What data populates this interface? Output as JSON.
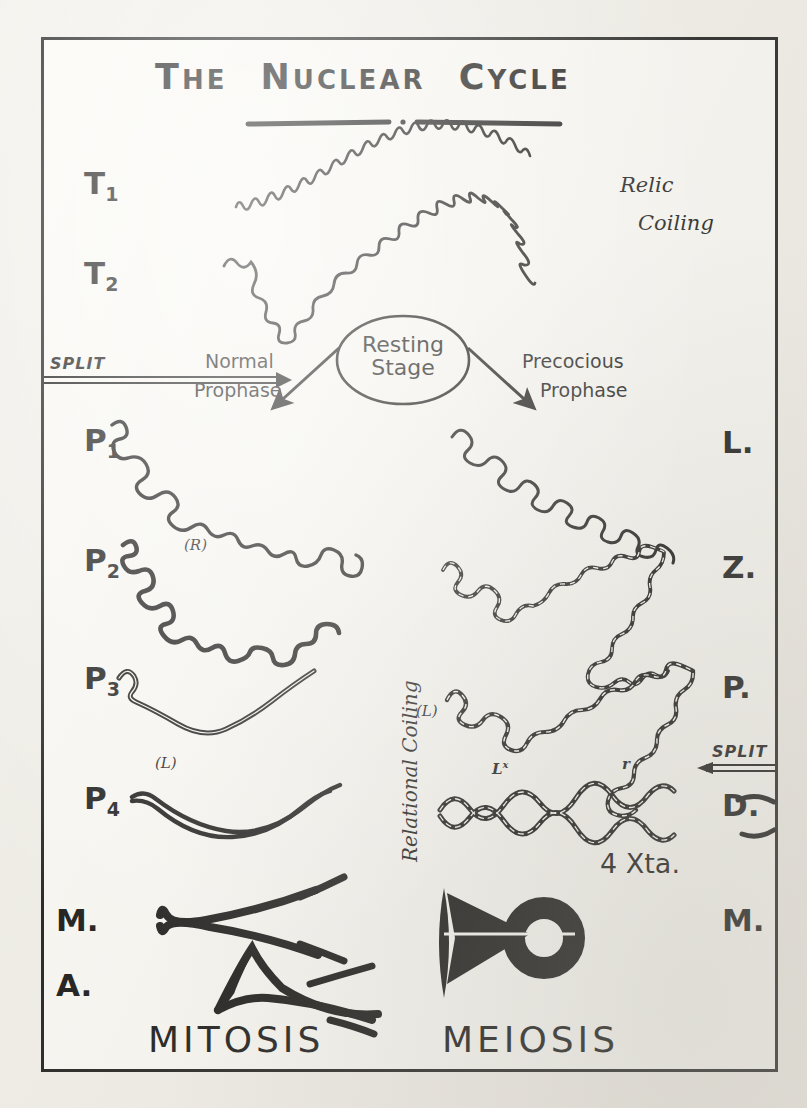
{
  "figure": {
    "title_words": [
      "The",
      "Nuclear",
      "Cycle"
    ],
    "title_plain": "THE NUCLEAR CYCLE",
    "background_color": "#f2f0ea",
    "ink_color": "#111111",
    "border_color": "#1a1a1a"
  },
  "annotations": {
    "relic_coiling_line1": "Relic",
    "relic_coiling_line2": "Coiling",
    "resting_stage_line1": "Resting",
    "resting_stage_line2": "Stage",
    "normal_prophase_line1": "Normal",
    "normal_prophase_line2": "Prophase",
    "precocious_prophase_line1": "Precocious",
    "precocious_prophase_line2": "Prophase",
    "relational_coiling": "Relational Coiling",
    "split_left": "SPLIT",
    "split_right": "SPLIT",
    "r_mark": "(R)",
    "l_mark_left": "(L)",
    "l_mark_middle": "(L)",
    "chiasma_lx": "L",
    "chiasma_lx_sup": "x",
    "chiasma_r": "r",
    "xta_count": "4 Xta."
  },
  "left_column": {
    "caption": "MITOSIS",
    "stages": [
      {
        "label": "T",
        "sub": "1"
      },
      {
        "label": "T",
        "sub": "2"
      },
      {
        "label": "P",
        "sub": "1"
      },
      {
        "label": "P",
        "sub": "2"
      },
      {
        "label": "P",
        "sub": "3"
      },
      {
        "label": "P",
        "sub": "4"
      },
      {
        "label": "M.",
        "sub": ""
      },
      {
        "label": "A.",
        "sub": ""
      }
    ]
  },
  "right_column": {
    "caption": "MEIOSIS",
    "stages": [
      {
        "label": "L.",
        "sub": ""
      },
      {
        "label": "Z.",
        "sub": ""
      },
      {
        "label": "P.",
        "sub": ""
      },
      {
        "label": "D.",
        "sub": ""
      },
      {
        "label": "M.",
        "sub": ""
      }
    ]
  }
}
